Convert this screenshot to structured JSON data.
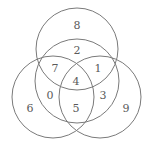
{
  "diagram": {
    "type": "venn",
    "stroke_color": "#7a7a7a",
    "text_color": "#5a5a5a",
    "circles": [
      {
        "name": "top",
        "cx": 77,
        "cy": 49,
        "r": 41
      },
      {
        "name": "middle",
        "cx": 77,
        "cy": 81,
        "r": 42
      },
      {
        "name": "left",
        "cx": 53,
        "cy": 97,
        "r": 41
      },
      {
        "name": "right",
        "cx": 100,
        "cy": 97,
        "r": 41
      }
    ],
    "regions": [
      {
        "label": "8",
        "x": 77,
        "y": 25
      },
      {
        "label": "2",
        "x": 77,
        "y": 50
      },
      {
        "label": "7",
        "x": 55,
        "y": 68
      },
      {
        "label": "1",
        "x": 98,
        "y": 68
      },
      {
        "label": "4",
        "x": 76,
        "y": 81
      },
      {
        "label": "0",
        "x": 50,
        "y": 95
      },
      {
        "label": "3",
        "x": 103,
        "y": 95
      },
      {
        "label": "6",
        "x": 30,
        "y": 108
      },
      {
        "label": "5",
        "x": 76,
        "y": 108
      },
      {
        "label": "9",
        "x": 126,
        "y": 108
      }
    ]
  }
}
